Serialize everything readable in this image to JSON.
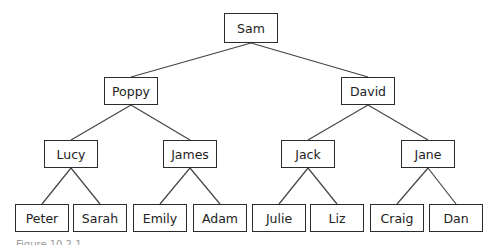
{
  "diagram": {
    "type": "tree",
    "root": "Sam",
    "nodes": {
      "sam": {
        "label": "Sam",
        "x": 224,
        "y": 13,
        "w": 54,
        "h": 30
      },
      "poppy": {
        "label": "Poppy",
        "x": 104,
        "y": 77,
        "w": 54,
        "h": 28
      },
      "david": {
        "label": "David",
        "x": 341,
        "y": 77,
        "w": 54,
        "h": 28
      },
      "lucy": {
        "label": "Lucy",
        "x": 44,
        "y": 140,
        "w": 54,
        "h": 28
      },
      "james": {
        "label": "James",
        "x": 163,
        "y": 140,
        "w": 54,
        "h": 28
      },
      "jack": {
        "label": "Jack",
        "x": 281,
        "y": 140,
        "w": 54,
        "h": 28
      },
      "jane": {
        "label": "Jane",
        "x": 401,
        "y": 140,
        "w": 54,
        "h": 28
      },
      "peter": {
        "label": "Peter",
        "x": 15,
        "y": 204,
        "w": 54,
        "h": 28
      },
      "sarah": {
        "label": "Sarah",
        "x": 73,
        "y": 204,
        "w": 54,
        "h": 28
      },
      "emily": {
        "label": "Emily",
        "x": 133,
        "y": 204,
        "w": 54,
        "h": 28
      },
      "adam": {
        "label": "Adam",
        "x": 193,
        "y": 204,
        "w": 54,
        "h": 28
      },
      "julie": {
        "label": "Julie",
        "x": 252,
        "y": 204,
        "w": 54,
        "h": 28
      },
      "liz": {
        "label": "Liz",
        "x": 310,
        "y": 204,
        "w": 54,
        "h": 28
      },
      "craig": {
        "label": "Craig",
        "x": 370,
        "y": 204,
        "w": 54,
        "h": 28
      },
      "dan": {
        "label": "Dan",
        "x": 429,
        "y": 204,
        "w": 54,
        "h": 28
      }
    },
    "edges": [
      [
        "sam",
        "poppy"
      ],
      [
        "sam",
        "david"
      ],
      [
        "poppy",
        "lucy"
      ],
      [
        "poppy",
        "james"
      ],
      [
        "david",
        "jack"
      ],
      [
        "david",
        "jane"
      ],
      [
        "lucy",
        "peter"
      ],
      [
        "lucy",
        "sarah"
      ],
      [
        "james",
        "emily"
      ],
      [
        "james",
        "adam"
      ],
      [
        "jack",
        "julie"
      ],
      [
        "jack",
        "liz"
      ],
      [
        "jane",
        "craig"
      ],
      [
        "jane",
        "dan"
      ]
    ],
    "colors": {
      "line": "#444444",
      "border": "#2b2b2b",
      "text": "#222222"
    }
  },
  "caption": "Figure 10.2.1"
}
